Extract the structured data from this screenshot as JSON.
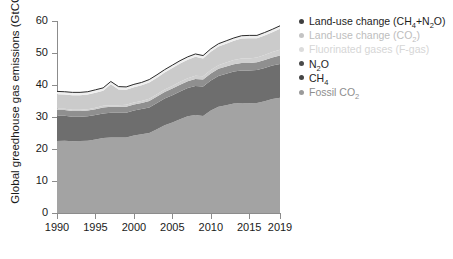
{
  "chart_data": {
    "type": "area",
    "stacked": true,
    "title": "",
    "xlabel": "",
    "ylabel": "Global greedhouse gas emissions (GtCO2e)",
    "ylabel_parts": {
      "prefix": "Global greedhouse gas emissions (GtCO",
      "sub": "2",
      "suffix": "e)"
    },
    "xlim": [
      1990,
      2019
    ],
    "ylim": [
      0,
      60
    ],
    "grid": false,
    "legend_position": "right",
    "x": [
      1990,
      1991,
      1992,
      1993,
      1994,
      1995,
      1996,
      1997,
      1998,
      1999,
      2000,
      2001,
      2002,
      2003,
      2004,
      2005,
      2006,
      2007,
      2008,
      2009,
      2010,
      2011,
      2012,
      2013,
      2014,
      2015,
      2016,
      2017,
      2018,
      2019
    ],
    "series": [
      {
        "name": "Fossil CO2",
        "label_parts": {
          "prefix": "Fossil CO",
          "sub": "2",
          "suffix": ""
        },
        "color": "#a3a3a3",
        "values": [
          22.5,
          22.6,
          22.4,
          22.5,
          22.6,
          23.0,
          23.4,
          23.6,
          23.6,
          23.6,
          24.2,
          24.6,
          25.0,
          26.2,
          27.4,
          28.3,
          29.3,
          30.2,
          30.6,
          30.3,
          32.0,
          33.2,
          33.7,
          34.2,
          34.4,
          34.3,
          34.4,
          34.9,
          35.6,
          36.0
        ]
      },
      {
        "name": "CH4",
        "label_parts": {
          "prefix": "CH",
          "sub": "4",
          "suffix": ""
        },
        "color": "#6e6e6e",
        "values": [
          7.9,
          7.8,
          7.7,
          7.6,
          7.6,
          7.6,
          7.7,
          7.7,
          7.7,
          7.7,
          7.8,
          7.9,
          8.0,
          8.2,
          8.4,
          8.5,
          8.7,
          8.9,
          9.1,
          9.2,
          9.4,
          9.6,
          9.8,
          10.0,
          10.1,
          10.2,
          10.3,
          10.4,
          10.5,
          10.6
        ]
      },
      {
        "name": "N2O",
        "label_parts": {
          "prefix": "N",
          "sub": "2",
          "suffix": "O"
        },
        "color": "#8f8f8f",
        "values": [
          1.8,
          1.8,
          1.8,
          1.8,
          1.8,
          1.8,
          1.9,
          1.9,
          1.9,
          1.9,
          1.9,
          1.9,
          2.0,
          2.0,
          2.0,
          2.1,
          2.1,
          2.1,
          2.2,
          2.2,
          2.2,
          2.3,
          2.3,
          2.3,
          2.4,
          2.4,
          2.4,
          2.5,
          2.5,
          2.6
        ]
      },
      {
        "name": "Fluorinated gases (F-gas)",
        "label_parts": {
          "prefix": "Fluorinated gases (F-gas)",
          "sub": "",
          "suffix": ""
        },
        "color": "#cfcfcf",
        "values": [
          0.4,
          0.4,
          0.4,
          0.4,
          0.4,
          0.5,
          0.5,
          0.5,
          0.5,
          0.6,
          0.6,
          0.6,
          0.7,
          0.7,
          0.8,
          0.8,
          0.9,
          0.9,
          1.0,
          1.0,
          1.1,
          1.1,
          1.2,
          1.3,
          1.4,
          1.4,
          1.5,
          1.6,
          1.7,
          1.8
        ]
      },
      {
        "name": "Land-use change (CO2)",
        "label_parts": {
          "prefix": "Land-use change (CO",
          "sub": "2",
          "suffix": ")"
        },
        "color": "#cbcbcb",
        "values": [
          4.5,
          4.4,
          4.5,
          4.5,
          4.6,
          4.7,
          4.7,
          6.5,
          4.9,
          4.7,
          4.8,
          4.9,
          5.1,
          5.2,
          5.3,
          5.6,
          5.7,
          5.8,
          5.9,
          5.6,
          5.7,
          5.8,
          5.9,
          6.0,
          6.2,
          6.3,
          6.0,
          6.1,
          6.2,
          6.6
        ]
      },
      {
        "name": "Land-use change (CH4+N2O)",
        "label_parts": {
          "prefix": "Land-use change (CH",
          "sub": "4",
          "suffix": "+N2O)"
        },
        "color": "#efefef",
        "values": [
          0.9,
          0.9,
          0.9,
          0.9,
          0.9,
          0.9,
          0.9,
          0.9,
          0.9,
          0.9,
          0.9,
          0.9,
          0.9,
          0.9,
          0.9,
          0.9,
          0.9,
          0.9,
          0.9,
          0.9,
          0.9,
          0.9,
          0.9,
          0.9,
          0.9,
          0.9,
          0.9,
          0.9,
          0.9,
          0.9
        ]
      }
    ],
    "totals": [
      38.0,
      37.9,
      37.7,
      37.7,
      37.9,
      38.5,
      39.1,
      41.1,
      39.5,
      39.4,
      40.2,
      40.8,
      41.7,
      43.2,
      44.8,
      46.2,
      47.6,
      48.8,
      49.7,
      49.2,
      51.3,
      52.9,
      53.8,
      54.7,
      55.4,
      55.5,
      55.5,
      56.4,
      57.4,
      58.5
    ],
    "yticks": [
      0,
      10,
      20,
      30,
      40,
      50,
      60
    ],
    "ytick_labels": [
      "0",
      "10",
      "20",
      "30",
      "40",
      "50",
      "60"
    ],
    "xticks": [
      1990,
      1995,
      2000,
      2005,
      2010,
      2015,
      2019
    ],
    "xtick_labels": [
      "1990",
      "1995",
      "2000",
      "2005",
      "2010",
      "2015",
      "2019"
    ],
    "legend": [
      {
        "label": "Land-use change (CH4+N2O)",
        "color": "#3f3f3f",
        "text_color": "#1d1d1d"
      },
      {
        "label": "Land-use change (CO2)",
        "color": "#c4c4c4",
        "text_color": "#bdbdbd"
      },
      {
        "label": "Fluorinated gases (F-gas)",
        "color": "#dcdcdc",
        "text_color": "#d6d6d6"
      },
      {
        "label": "N2O",
        "color": "#4a4a4a",
        "text_color": "#262626"
      },
      {
        "label": "CH4",
        "color": "#454545",
        "text_color": "#242424"
      },
      {
        "label": "Fossil CO2",
        "color": "#9a9a9a",
        "text_color": "#8e8e8e"
      }
    ]
  },
  "colors": {
    "axis": "#8c8c8c",
    "text": "#1a1a1a",
    "background": "#ffffff",
    "outline": "#2b2b2b"
  }
}
